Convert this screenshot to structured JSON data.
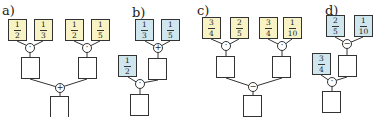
{
  "colors": {
    "yellow": "#f7f3c4",
    "blue": "#cfe6ef",
    "stroke": "#333333"
  },
  "panels": [
    {
      "label": "a)",
      "color": "yellow",
      "inputs": [
        {
          "num": "1",
          "den": "2"
        },
        {
          "num": "1",
          "den": "3"
        },
        {
          "num": "1",
          "den": "2"
        },
        {
          "num": "1",
          "den": "5"
        }
      ],
      "ops": [
        "·",
        "·",
        "+"
      ]
    },
    {
      "label": "b)",
      "color": "blue",
      "inputs": [
        {
          "num": "1",
          "den": "3"
        },
        {
          "num": "1",
          "den": "5"
        },
        {
          "num": "1",
          "den": "2"
        }
      ],
      "ops": [
        "+",
        "·"
      ]
    },
    {
      "label": "c)",
      "color": "yellow",
      "inputs": [
        {
          "num": "3",
          "den": "4"
        },
        {
          "num": "2",
          "den": "5"
        },
        {
          "num": "3",
          "den": "4"
        },
        {
          "num": "1",
          "den": "10"
        }
      ],
      "ops": [
        "·",
        "·",
        "−"
      ]
    },
    {
      "label": "d)",
      "color": "blue",
      "inputs": [
        {
          "num": "2",
          "den": "5"
        },
        {
          "num": "1",
          "den": "10"
        },
        {
          "num": "3",
          "den": "4"
        }
      ],
      "ops": [
        "−",
        "·"
      ]
    }
  ]
}
